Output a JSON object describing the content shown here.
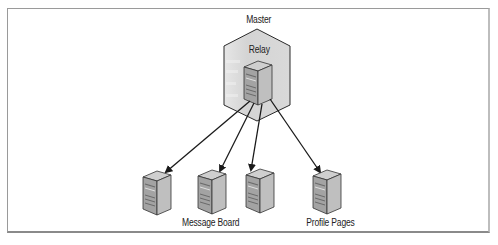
{
  "diagram": {
    "type": "relay-architecture",
    "container": {
      "label": "Master"
    },
    "relay": {
      "label": "Relay"
    },
    "nodes": [
      {
        "id": "server-1",
        "label": ""
      },
      {
        "id": "server-2",
        "label": "Message Board"
      },
      {
        "id": "server-3",
        "label": ""
      },
      {
        "id": "server-4",
        "label": "Profile Pages"
      }
    ],
    "edges": [
      {
        "from": "relay",
        "to": "server-1"
      },
      {
        "from": "relay",
        "to": "server-2"
      },
      {
        "from": "relay",
        "to": "server-3"
      },
      {
        "from": "relay",
        "to": "server-4"
      }
    ],
    "colors": {
      "container_fill": "#d9d9d9",
      "server_front": "#9e9e9e",
      "server_side": "#bdbdbd",
      "server_top": "#c9c9c9",
      "edge": "#1a1a1a"
    }
  }
}
